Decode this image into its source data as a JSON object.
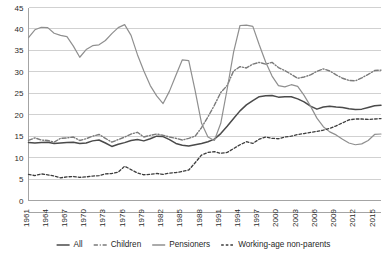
{
  "chart_data": {
    "type": "line",
    "title": "",
    "subtitle": "",
    "xlabel": "",
    "ylabel": "",
    "ylim": [
      0,
      45
    ],
    "xlim": [
      1961,
      2016
    ],
    "grid": true,
    "legend_position": "bottom",
    "ytick_labels": [
      "0",
      "5",
      "10",
      "15",
      "20",
      "25",
      "30",
      "35",
      "40",
      "45"
    ],
    "ytick_values": [
      0,
      5,
      10,
      15,
      20,
      25,
      30,
      35,
      40,
      45
    ],
    "xtick_labels": [
      "1961",
      "1964",
      "1967",
      "1970",
      "1973",
      "1976",
      "1979",
      "1982",
      "1985",
      "1988",
      "1991",
      "1994",
      "1997",
      "2000",
      "2003",
      "2006",
      "2009",
      "2012",
      "2015"
    ],
    "xtick_values": [
      1961,
      1964,
      1967,
      1970,
      1973,
      1976,
      1979,
      1982,
      1985,
      1988,
      1991,
      1994,
      1997,
      2000,
      2003,
      2006,
      2009,
      2012,
      2015
    ],
    "x": [
      1961,
      1962,
      1963,
      1964,
      1965,
      1966,
      1967,
      1968,
      1969,
      1970,
      1971,
      1972,
      1973,
      1974,
      1975,
      1976,
      1977,
      1978,
      1979,
      1980,
      1981,
      1982,
      1983,
      1984,
      1985,
      1986,
      1987,
      1988,
      1989,
      1990,
      1991,
      1992,
      1993,
      1994,
      1995,
      1996,
      1997,
      1998,
      1999,
      2000,
      2001,
      2002,
      2003,
      2004,
      2005,
      2006,
      2007,
      2008,
      2009,
      2010,
      2011,
      2012,
      2013,
      2014,
      2015,
      2016
    ],
    "series": [
      {
        "name": "All",
        "style": "solid",
        "color": "#4a4a4a",
        "width": 1.5,
        "values": [
          13.5,
          13.4,
          13.5,
          13.6,
          13.3,
          13.4,
          13.5,
          13.6,
          13.3,
          13.4,
          13.9,
          14.1,
          13.4,
          12.6,
          13.1,
          13.5,
          14.0,
          14.2,
          13.9,
          14.4,
          15.0,
          14.9,
          14.2,
          13.3,
          12.9,
          12.7,
          13.0,
          13.3,
          13.7,
          14.3,
          15.6,
          17.3,
          19.1,
          20.9,
          22.3,
          23.3,
          24.2,
          24.4,
          24.5,
          24.1,
          24.2,
          24.2,
          23.7,
          23.0,
          22.0,
          21.3,
          21.8,
          22.0,
          21.8,
          21.7,
          21.4,
          21.2,
          21.3,
          21.7,
          22.1,
          22.2
        ]
      },
      {
        "name": "Children",
        "style": "dashdot",
        "color": "#7a7a7a",
        "width": 1.4,
        "values": [
          14.0,
          14.6,
          14.1,
          14.0,
          13.6,
          14.5,
          14.6,
          14.8,
          14.0,
          14.4,
          15.0,
          15.4,
          14.5,
          13.6,
          14.2,
          14.8,
          15.5,
          15.9,
          14.8,
          15.2,
          15.5,
          15.2,
          14.8,
          14.5,
          14.1,
          14.5,
          15.0,
          17.0,
          19.5,
          22.2,
          25.2,
          26.8,
          30.2,
          31.2,
          30.9,
          31.8,
          32.2,
          31.8,
          32.2,
          31.0,
          30.3,
          29.4,
          28.5,
          28.8,
          29.3,
          30.1,
          30.7,
          30.2,
          29.3,
          28.5,
          28.0,
          27.9,
          28.6,
          29.4,
          30.3,
          30.4
        ]
      },
      {
        "name": "Pensioners",
        "style": "solid",
        "color": "#8f8f8f",
        "width": 1.2,
        "values": [
          38.0,
          39.8,
          40.4,
          40.3,
          39.0,
          38.5,
          38.2,
          36.0,
          33.4,
          35.2,
          36.1,
          36.3,
          37.3,
          38.9,
          40.3,
          41.0,
          38.5,
          34.0,
          30.2,
          26.8,
          24.4,
          22.6,
          25.5,
          29.2,
          32.8,
          32.6,
          25.6,
          18.0,
          14.8,
          14.0,
          18.0,
          26.0,
          34.6,
          40.8,
          40.9,
          40.6,
          36.3,
          32.3,
          29.0,
          26.8,
          26.5,
          27.0,
          26.6,
          24.5,
          22.0,
          19.2,
          17.2,
          16.0,
          15.3,
          14.3,
          13.4,
          13.0,
          13.2,
          14.0,
          15.4,
          15.5
        ]
      },
      {
        "name": "Working-age non-parents",
        "style": "dashed",
        "color": "#3d3d3d",
        "width": 1.3,
        "values": [
          6.1,
          5.8,
          6.2,
          6.0,
          5.7,
          5.3,
          5.5,
          5.6,
          5.4,
          5.5,
          5.7,
          5.8,
          6.2,
          6.3,
          6.6,
          8.0,
          7.2,
          6.4,
          6.0,
          6.1,
          6.3,
          6.1,
          6.4,
          6.5,
          6.8,
          7.1,
          8.8,
          10.6,
          11.2,
          11.4,
          11.0,
          11.2,
          12.1,
          13.0,
          13.7,
          13.3,
          14.3,
          14.8,
          14.5,
          14.4,
          14.8,
          15.0,
          15.4,
          15.6,
          15.9,
          16.1,
          16.4,
          16.8,
          17.4,
          18.1,
          18.8,
          19.0,
          19.0,
          18.9,
          19.0,
          19.1
        ]
      }
    ],
    "legend": [
      {
        "label": "All",
        "style": "solid",
        "color": "#4a4a4a"
      },
      {
        "label": "Children",
        "style": "dashdot",
        "color": "#7a7a7a"
      },
      {
        "label": "Pensioners",
        "style": "solid",
        "color": "#8f8f8f"
      },
      {
        "label": "Working-age non-parents",
        "style": "dashed",
        "color": "#3d3d3d"
      }
    ]
  }
}
